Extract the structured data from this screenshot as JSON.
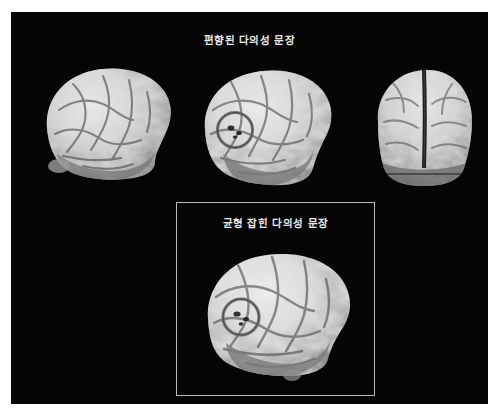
{
  "figure": {
    "background_color": "#ffffff",
    "panel_color": "#050505",
    "text_color": "#e9e9e9",
    "border_color": "#b9b9b9",
    "top_title": "편향된 다의성 문장",
    "sub_panel_title": "균형 잡힌 다의성 문장"
  },
  "brains": {
    "top_row": [
      {
        "name": "brain-lateral-left",
        "view": "lateral",
        "facing": "right",
        "marker": false,
        "marker_label": ""
      },
      {
        "name": "brain-lateral-mid",
        "view": "lateral",
        "facing": "right",
        "marker": true,
        "marker_label": "activation-circle"
      },
      {
        "name": "brain-anterior-right",
        "view": "anterior",
        "facing": "front",
        "marker": false,
        "marker_label": ""
      }
    ],
    "sub_panel": [
      {
        "name": "brain-lateral-bottom",
        "view": "lateral",
        "facing": "right",
        "marker": true,
        "marker_label": "activation-circle"
      }
    ]
  }
}
